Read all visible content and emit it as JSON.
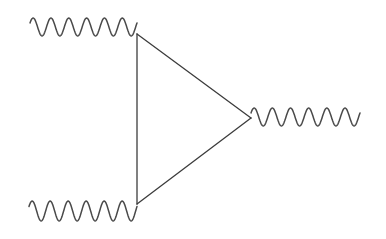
{
  "diagram": {
    "type": "feynman-diagram",
    "colors": {
      "stroke": "#3c3c3c",
      "wave": "#4a4a4a",
      "background": "#ffffff"
    },
    "vertices": [
      {
        "id": "top-left",
        "x": 137,
        "y": 34
      },
      {
        "id": "bottom-left",
        "x": 137,
        "y": 204
      },
      {
        "id": "right",
        "x": 251,
        "y": 118
      }
    ],
    "internal_lines": [
      {
        "from": "top-left",
        "to": "bottom-left"
      },
      {
        "from": "top-left",
        "to": "right"
      },
      {
        "from": "bottom-left",
        "to": "right"
      }
    ],
    "external_lines": [
      {
        "id": "photon-top-left",
        "style": "wavy",
        "x_start": 30,
        "x_end": 137,
        "y_center": 27,
        "amplitude": 9,
        "periods": 6,
        "attach": "top-left"
      },
      {
        "id": "photon-bottom-left",
        "style": "wavy",
        "x_start": 29,
        "x_end": 137,
        "y_center": 211,
        "amplitude": 10,
        "periods": 6,
        "attach": "bottom-left"
      },
      {
        "id": "photon-right",
        "style": "wavy",
        "x_start": 251,
        "x_end": 360,
        "y_center": 117,
        "amplitude": 9,
        "periods": 6,
        "attach": "right"
      }
    ]
  }
}
